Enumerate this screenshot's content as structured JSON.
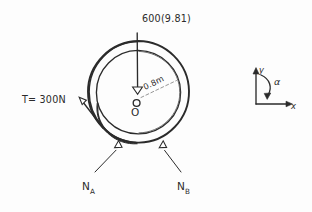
{
  "figure": {
    "background_color": "#fdfdfd",
    "ink_color": "#2b2b2b"
  },
  "labels": {
    "weight": "600(9.81)",
    "tension": "T= 300N",
    "radius": "0.8m",
    "center": "O",
    "normal_a_base": "N",
    "normal_a_sub": "A",
    "normal_b_base": "N",
    "normal_b_sub": "B"
  },
  "axes": {
    "y_label": "y",
    "x_label": "x",
    "alpha_label": "α"
  },
  "geometry": {
    "center_x": 138,
    "center_y": 92,
    "outer_radius": 51,
    "inner_radius": 42,
    "rim_radius": 46
  }
}
